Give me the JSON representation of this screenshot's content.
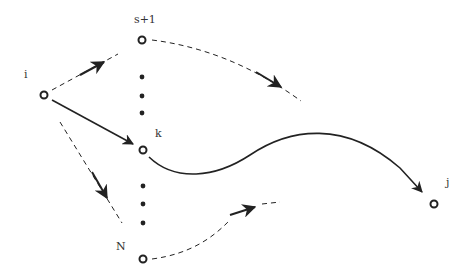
{
  "diagram": {
    "nodes": [
      {
        "id": "i",
        "label": "i",
        "x": 44,
        "y": 95
      },
      {
        "id": "s+1",
        "label": "s+1",
        "x": 142,
        "y": 40
      },
      {
        "id": "k",
        "label": "k",
        "x": 143,
        "y": 150
      },
      {
        "id": "N",
        "label": "N",
        "x": 143,
        "y": 259
      },
      {
        "id": "j",
        "label": "j",
        "x": 434,
        "y": 204
      }
    ],
    "labels": {
      "i": "i",
      "s_plus_1": "s+1",
      "k": "k",
      "N": "N",
      "j": "j"
    },
    "edges": [
      {
        "from": "i",
        "to": "s+1",
        "style": "dashed",
        "arrow": "mid"
      },
      {
        "from": "i",
        "to": "k",
        "style": "solid",
        "arrow": "end"
      },
      {
        "from": "i",
        "to": "N",
        "style": "dashed",
        "arrow": "mid"
      },
      {
        "from": "s+1",
        "to": "continuation",
        "style": "dashed",
        "arrow": "mid"
      },
      {
        "from": "k",
        "to": "j",
        "style": "solid",
        "arrow": "end"
      },
      {
        "from": "N",
        "to": "continuation",
        "style": "dashed",
        "arrow": "mid"
      }
    ],
    "ellipsis_groups": [
      {
        "between": [
          "s+1",
          "k"
        ],
        "count": 3
      },
      {
        "between": [
          "k",
          "N"
        ],
        "count": 3
      }
    ],
    "colors": {
      "stroke": "#222222",
      "label": "#333333",
      "background": "#ffffff"
    }
  }
}
